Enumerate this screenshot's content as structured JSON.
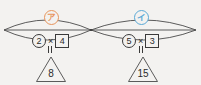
{
  "figure": {
    "background_color": "#f3f2f0",
    "stroke_color": "#3a3a3a",
    "labels": [
      {
        "id": "label-a",
        "text": "ア",
        "color": "#e8945c",
        "description": "circled-katakana-a"
      },
      {
        "id": "label-i",
        "text": "イ",
        "color": "#5aa9d6",
        "description": "circled-katakana-i"
      }
    ],
    "groups": [
      {
        "id": "group-a",
        "label": "ア",
        "circled_number": "2",
        "operator": "×",
        "boxed_number": "4",
        "equals": "=",
        "result": "8"
      },
      {
        "id": "group-i",
        "label": "イ",
        "circled_number": "5",
        "operator": "×",
        "boxed_number": "3",
        "equals": "=",
        "result": "15"
      }
    ]
  }
}
